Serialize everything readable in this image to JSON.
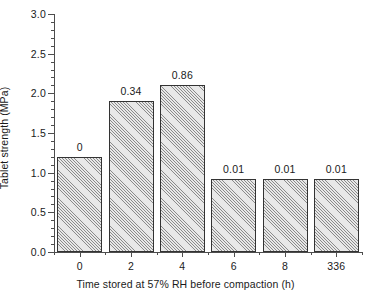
{
  "chart_data": {
    "type": "bar",
    "title": "",
    "xlabel": "Time stored at 57% RH before compaction (h)",
    "ylabel": "Tablet strength (MPa)",
    "categories": [
      "0",
      "2",
      "4",
      "6",
      "8",
      "336"
    ],
    "values": [
      1.2,
      1.9,
      2.1,
      0.92,
      0.92,
      0.92
    ],
    "error_labels": [
      "0",
      "0.34",
      "0.86",
      "0.01",
      "0.01",
      "0.01"
    ],
    "ylim": [
      0.0,
      3.0
    ],
    "ytick_labels": [
      "0.0",
      "0.5",
      "1.0",
      "1.5",
      "2.0",
      "2.5",
      "3.0"
    ],
    "ytick_values": [
      0.0,
      0.5,
      1.0,
      1.5,
      2.0,
      2.5,
      3.0
    ],
    "ytick_minor_step": 0.1,
    "grid": false,
    "legend": null,
    "bar_fill": "hatched-diagonal-gray",
    "bar_edge_color": "#333333",
    "axis_color": "#4d4d4d",
    "text_color": "#1a1a1a"
  }
}
